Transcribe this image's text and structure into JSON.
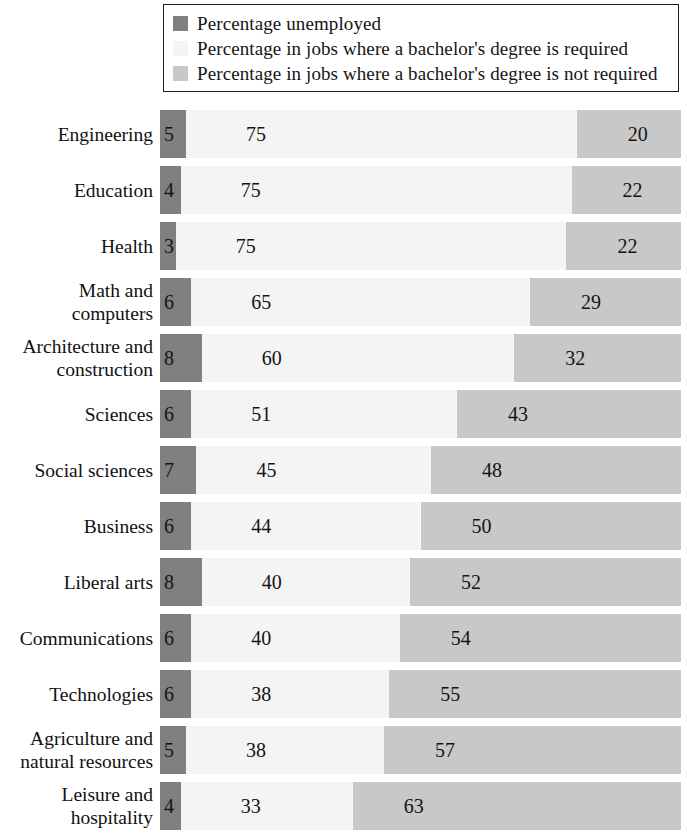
{
  "legend": {
    "items": [
      {
        "label": "Percentage unemployed",
        "color": "#808080",
        "swatch_name": "legend-swatch-unemployed"
      },
      {
        "label": "Percentage in jobs where a bachelor's degree is required",
        "color": "#f4f4f4",
        "swatch_name": "legend-swatch-required"
      },
      {
        "label": "Percentage in jobs where a bachelor's degree is not required",
        "color": "#c8c8c8",
        "swatch_name": "legend-swatch-not-required"
      }
    ]
  },
  "colors": {
    "unemployed": "#808080",
    "degree_required": "#f4f4f4",
    "degree_not_required": "#c8c8c8",
    "text": "#111111",
    "legend_border": "#1d1d1d",
    "background": "#ffffff"
  },
  "chart_data": {
    "type": "bar",
    "subtype": "stacked-horizontal-100pct",
    "title": "",
    "subtitle": "",
    "xlabel": "",
    "ylabel": "",
    "xlim": [
      0,
      100
    ],
    "grid": false,
    "legend_position": "top",
    "categories": [
      "Engineering",
      "Education",
      "Health",
      "Math and computers",
      "Architecture and construction",
      "Sciences",
      "Social sciences",
      "Business",
      "Liberal arts",
      "Communications",
      "Technologies",
      "Agriculture and natural resources",
      "Leisure and hospitality"
    ],
    "series": [
      {
        "name": "Percentage unemployed",
        "color": "#808080",
        "values": [
          5,
          4,
          3,
          6,
          8,
          6,
          7,
          6,
          8,
          6,
          6,
          5,
          4
        ]
      },
      {
        "name": "Percentage in jobs where a bachelor's degree is required",
        "color": "#f4f4f4",
        "values": [
          75,
          75,
          75,
          65,
          60,
          51,
          45,
          44,
          40,
          40,
          38,
          38,
          33
        ]
      },
      {
        "name": "Percentage in jobs where a bachelor's degree is not required",
        "color": "#c8c8c8",
        "values": [
          20,
          22,
          22,
          29,
          32,
          43,
          48,
          50,
          52,
          54,
          55,
          57,
          63
        ]
      }
    ]
  },
  "rows": [
    {
      "label": "Engineering",
      "label_lines": "Engineering",
      "unemployed": 5,
      "required": 75,
      "not_required": 20
    },
    {
      "label": "Education",
      "label_lines": "Education",
      "unemployed": 4,
      "required": 75,
      "not_required": 22
    },
    {
      "label": "Health",
      "label_lines": "Health",
      "unemployed": 3,
      "required": 75,
      "not_required": 22
    },
    {
      "label": "Math and computers",
      "label_lines": "Math and\ncomputers",
      "unemployed": 6,
      "required": 65,
      "not_required": 29
    },
    {
      "label": "Architecture and construction",
      "label_lines": "Architecture and\nconstruction",
      "unemployed": 8,
      "required": 60,
      "not_required": 32
    },
    {
      "label": "Sciences",
      "label_lines": "Sciences",
      "unemployed": 6,
      "required": 51,
      "not_required": 43
    },
    {
      "label": "Social sciences",
      "label_lines": "Social sciences",
      "unemployed": 7,
      "required": 45,
      "not_required": 48
    },
    {
      "label": "Business",
      "label_lines": "Business",
      "unemployed": 6,
      "required": 44,
      "not_required": 50
    },
    {
      "label": "Liberal arts",
      "label_lines": "Liberal arts",
      "unemployed": 8,
      "required": 40,
      "not_required": 52
    },
    {
      "label": "Communications",
      "label_lines": "Communications",
      "unemployed": 6,
      "required": 40,
      "not_required": 54
    },
    {
      "label": "Technologies",
      "label_lines": "Technologies",
      "unemployed": 6,
      "required": 38,
      "not_required": 55
    },
    {
      "label": "Agriculture and natural resources",
      "label_lines": "Agriculture and\nnatural resources",
      "unemployed": 5,
      "required": 38,
      "not_required": 57
    },
    {
      "label": "Leisure and hospitality",
      "label_lines": "Leisure and\nhospitality",
      "unemployed": 4,
      "required": 33,
      "not_required": 63
    }
  ]
}
